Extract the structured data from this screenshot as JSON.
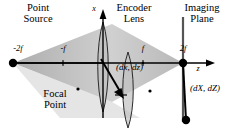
{
  "figure": {
    "type": "optical-ray-diagram",
    "title_labels": {
      "point_source": "Point\nSource",
      "point_source_line1": "Point",
      "point_source_line2": "Source",
      "encoder_lens_line1": "Encoder",
      "encoder_lens_line2": "Lens",
      "imaging_plane_line1": "Imaging",
      "imaging_plane_line2": "Plane",
      "focal_point_line1": "Focal",
      "focal_point_line2": "Point"
    },
    "axes": {
      "horizontal_label": "z",
      "vertical_label": "x",
      "ticks": [
        {
          "label": "-2f",
          "position": "source"
        },
        {
          "label": "-f",
          "position": "front-focal"
        },
        {
          "label": "f",
          "position": "back-focal"
        },
        {
          "label": "2f",
          "position": "image"
        }
      ]
    },
    "annotations": {
      "object_displacement": "(dx, dz)",
      "image_displacement": "(dX, dZ)"
    },
    "colors": {
      "cone_fill": "#b9b9b9",
      "line": "#000000",
      "lens_fill": "#c8c8c8",
      "background": "#ffffff"
    }
  }
}
